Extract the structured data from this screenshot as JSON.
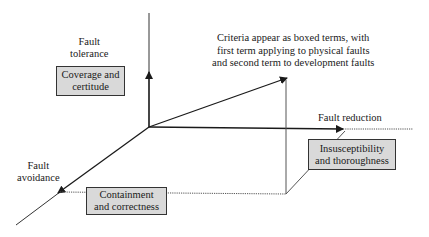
{
  "diagram": {
    "axes": {
      "fault_tolerance": {
        "label_line1": "Fault",
        "label_line2": "tolerance"
      },
      "fault_reduction": {
        "label": "Fault reduction"
      },
      "fault_avoidance": {
        "label_line1": "Fault",
        "label_line2": "avoidance"
      }
    },
    "boxes": {
      "coverage": {
        "line1": "Coverage and",
        "line2": "certitude"
      },
      "containment": {
        "line1": "Containment",
        "line2": "and correctness"
      },
      "insusceptibility": {
        "line1": "Insusceptibility",
        "line2": "and thoroughness"
      }
    },
    "note": {
      "line1": "Criteria appear as boxed terms, with",
      "line2": "first term applying to physical faults",
      "line3": "and second term to development faults"
    },
    "colors": {
      "line": "#1a1a1a",
      "dotted": "#555555",
      "box_fill": "#d9d9d9",
      "box_border": "#333333"
    }
  }
}
